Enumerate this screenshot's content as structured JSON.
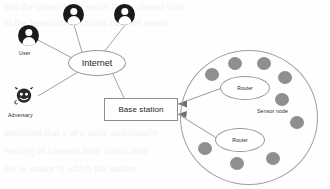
{
  "diagram": {
    "background_text": [
      "and the network the secret key is shared with",
      "to the base station. In this case the sensor",
      "described that a new node additionally",
      "reading of a sensor node which may",
      "the in sensor in which the authen"
    ]
  },
  "users": [
    {
      "id": "user-1",
      "label": "User",
      "icon": "user-icon"
    },
    {
      "id": "user-2",
      "label": "",
      "icon": "user-icon"
    },
    {
      "id": "user-3",
      "label": "",
      "icon": "user-icon"
    }
  ],
  "adversary": {
    "label": "Adversary",
    "icon": "devil-icon"
  },
  "internet": {
    "label": "Internet"
  },
  "base_station": {
    "label": "Base station"
  },
  "routers": [
    {
      "id": "router-top",
      "label": "Router"
    },
    {
      "id": "router-bottom",
      "label": "Router"
    }
  ],
  "sensor_network": {
    "legend_label": "Sensor node",
    "node_count": 9
  },
  "colors": {
    "person_fill": "#1a1a1a",
    "sensor_fill": "#8f8f8f",
    "line": "#8d8d8d",
    "cluster_outline": "#9e9e9e",
    "text": "#1d1d1d",
    "bleed_text": "#f1f1f1"
  }
}
